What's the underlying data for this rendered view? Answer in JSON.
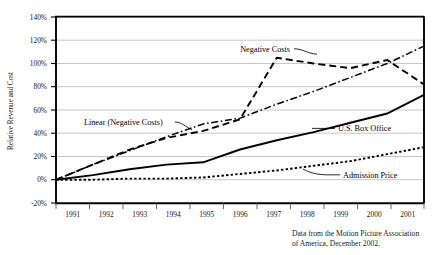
{
  "chart_data": {
    "type": "line",
    "title": "",
    "xlabel": "",
    "ylabel": "Relative Revenue and Cost",
    "ylim": [
      -20,
      140
    ],
    "ytick_labels": [
      "140%",
      "120%",
      "100%",
      "80%",
      "60%",
      "40%",
      "20%",
      "0%",
      "-20%"
    ],
    "ytick_values": [
      140,
      120,
      100,
      80,
      60,
      40,
      20,
      0,
      -20
    ],
    "grid": true,
    "legend_position": "inline-annotations",
    "categories": [
      "1991",
      "1992",
      "1993",
      "1994",
      "1995",
      "1996",
      "1997",
      "1998",
      "1999",
      "2000",
      "2001"
    ],
    "x": [
      1991,
      1992,
      1993,
      1994,
      1995,
      1996,
      1997,
      1998,
      1999,
      2000,
      2001
    ],
    "series": [
      {
        "name": "Negative Costs",
        "style": "dashed",
        "values": [
          0,
          13,
          26,
          36,
          42,
          52,
          105,
          100,
          96,
          103,
          82
        ]
      },
      {
        "name": "Linear (Negative Costs)",
        "style": "dash-dot",
        "values": [
          0,
          13,
          25,
          37,
          48,
          53,
          65,
          76,
          88,
          100,
          115
        ]
      },
      {
        "name": "U.S. Box Office",
        "style": "solid",
        "values": [
          0,
          4,
          9,
          13,
          15,
          26,
          34,
          41,
          49,
          57,
          73
        ]
      },
      {
        "name": "Admission Price",
        "style": "dotted",
        "values": [
          0,
          0,
          1,
          1,
          2,
          5,
          8,
          12,
          16,
          22,
          28
        ]
      }
    ],
    "annotations": [
      {
        "name": "Negative Costs",
        "label": "Negative Costs"
      },
      {
        "name": "Linear (Negative Costs)",
        "label": "Linear  (Negative Costs)"
      },
      {
        "name": "U.S. Box Office",
        "label": "U.S. Box Office"
      },
      {
        "name": "Admission Price",
        "label": "Admission Price"
      }
    ],
    "caption": {
      "line1": "Data from the Motion Picture Association",
      "line2": "of America, December 2002."
    }
  },
  "colors": {
    "ink": "#000000",
    "grid": "#b8b8b8",
    "background": "#ffffff"
  }
}
